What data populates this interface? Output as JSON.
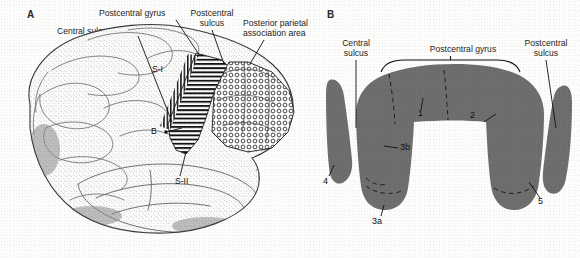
{
  "figure": {
    "type": "anatomical-illustration"
  },
  "panel_a": {
    "letter": "A",
    "labels": {
      "postcentral_gyrus": "Postcentral gyrus",
      "postcentral_sulcus_l1": "Postcentral",
      "postcentral_sulcus_l2": "sulcus",
      "central_sulcus": "Central sulcus",
      "posterior_parietal_l1": "Posterior parietal",
      "posterior_parietal_l2": "association area"
    },
    "markers": {
      "s1": "S-I",
      "s2": "S-II",
      "b": "B"
    },
    "patterns": {
      "s1_fill": "horizontal-line-hatch",
      "posterior_parietal_fill": "circle-stipple",
      "brain_fill": "stipple-line-drawing"
    }
  },
  "panel_b": {
    "letter": "B",
    "labels": {
      "central_sulcus_l1": "Central",
      "central_sulcus_l2": "sulcus",
      "postcentral_gyrus": "Postcentral gyrus",
      "postcentral_sulcus_l1": "Postcentral",
      "postcentral_sulcus_l2": "sulcus"
    },
    "areas": [
      {
        "id": "4",
        "label": "4",
        "name": "area-4"
      },
      {
        "id": "3a",
        "label": "3a",
        "name": "area-3a"
      },
      {
        "id": "3b",
        "label": "3b",
        "name": "area-3b"
      },
      {
        "id": "1",
        "label": "1",
        "name": "area-1"
      },
      {
        "id": "2",
        "label": "2",
        "name": "area-2"
      },
      {
        "id": "5",
        "label": "5",
        "name": "area-5"
      }
    ],
    "cortex_fill": "#6e6e6e",
    "bracket": "postcentral-gyrus-span"
  },
  "colors": {
    "background": "#fdfdfb",
    "ink": "#1d1d1d",
    "cortex_gray": "#6e6e6e",
    "leader_line": "#111111"
  }
}
